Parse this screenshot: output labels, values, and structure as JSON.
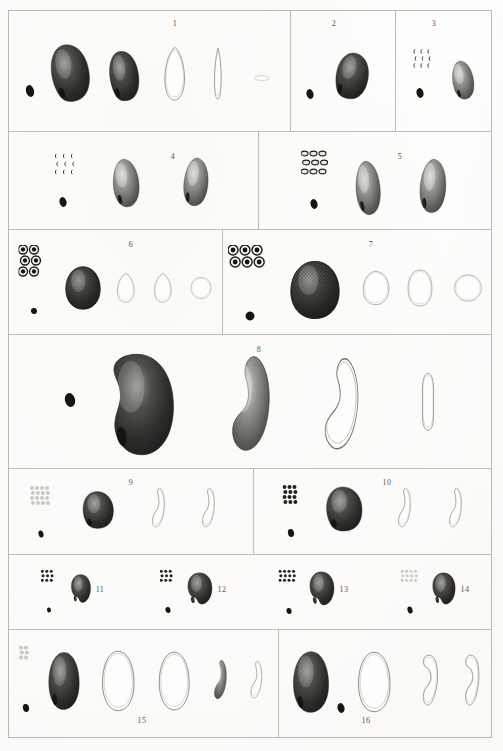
{
  "plate": {
    "title": "Engraved natural history plate of seed specimens",
    "medium": "stipple engraving on paper",
    "background_color": "#fbfaf8",
    "ink_color": "#2a2a28",
    "rule_color": "#bdbdb8",
    "frame": {
      "x": 8,
      "y": 10,
      "width": 484,
      "height": 728
    },
    "figure_count": 16
  },
  "rows": [
    {
      "id": "row-1",
      "top": 10,
      "bottom": 131
    },
    {
      "id": "row-2",
      "top": 131,
      "bottom": 229
    },
    {
      "id": "row-3",
      "top": 229,
      "bottom": 334
    },
    {
      "id": "row-4",
      "top": 334,
      "bottom": 468
    },
    {
      "id": "row-5",
      "top": 468,
      "bottom": 554
    },
    {
      "id": "row-6",
      "top": 554,
      "bottom": 629
    },
    {
      "id": "row-7",
      "top": 629,
      "bottom": 738
    }
  ],
  "figures": [
    {
      "number": "1",
      "row": 1,
      "panel": {
        "x": 8,
        "y": 10,
        "w": 282,
        "h": 121
      },
      "label": {
        "x": 175,
        "y": 19
      },
      "tiny_seed": {
        "x": 30,
        "y": 91,
        "rx": 4,
        "ry": 6
      },
      "dot_cluster": null,
      "specimens": [
        {
          "name": "seed-dorsal-view",
          "kind": "bean-dark",
          "cx": 70,
          "cy": 73,
          "w": 44,
          "h": 62,
          "rot": -8,
          "tone": "dark"
        },
        {
          "name": "seed-lateral-view",
          "kind": "bean-dark",
          "cx": 124,
          "cy": 76,
          "w": 34,
          "h": 54,
          "rot": -6,
          "tone": "dark"
        },
        {
          "name": "seed-section-outline",
          "kind": "teardrop-outline",
          "cx": 175,
          "cy": 74,
          "w": 28,
          "h": 58,
          "rot": 0,
          "tone": "outline"
        },
        {
          "name": "seed-embryo-outline",
          "kind": "sliver-outline",
          "cx": 218,
          "cy": 74,
          "w": 18,
          "h": 56,
          "rot": 0,
          "tone": "outline"
        },
        {
          "name": "seed-transverse-outline",
          "kind": "ellipse-outline",
          "cx": 262,
          "cy": 78,
          "w": 20,
          "h": 11,
          "rot": 0,
          "tone": "outline"
        }
      ]
    },
    {
      "number": "2",
      "row": 1,
      "panel": {
        "x": 290,
        "y": 10,
        "w": 105,
        "h": 121
      },
      "label": {
        "x": 334,
        "y": 19
      },
      "tiny_seed": {
        "x": 310,
        "y": 92,
        "rx": 3.5,
        "ry": 5
      },
      "dot_cluster": null,
      "specimens": [
        {
          "name": "seed-dorsal-view",
          "kind": "bean-dark",
          "cx": 352,
          "cy": 76,
          "w": 38,
          "h": 50,
          "rot": 12,
          "tone": "dark"
        }
      ]
    },
    {
      "number": "3",
      "row": 1,
      "panel": {
        "x": 395,
        "y": 10,
        "w": 97,
        "h": 121
      },
      "label": {
        "x": 434,
        "y": 19
      },
      "tiny_seed": {
        "x": 420,
        "y": 91,
        "rx": 3.5,
        "ry": 5
      },
      "dot_cluster": {
        "x": 424,
        "y": 62,
        "cols": 3,
        "rows": 3,
        "dot": "crescent",
        "size": 5,
        "gap": 7
      },
      "specimens": [
        {
          "name": "seed-dorsal-view",
          "kind": "bean-stipple",
          "cx": 463,
          "cy": 80,
          "w": 26,
          "h": 42,
          "rot": -10,
          "tone": "mid"
        }
      ]
    },
    {
      "number": "4",
      "row": 2,
      "panel": {
        "x": 8,
        "y": 131,
        "w": 250,
        "h": 98
      },
      "label": {
        "x": 173,
        "y": 152
      },
      "tiny_seed": {
        "x": 63,
        "y": 200,
        "rx": 3.5,
        "ry": 5
      },
      "dot_cluster": {
        "x": 67,
        "y": 168,
        "cols": 3,
        "rows": 3,
        "dot": "crescent",
        "size": 5,
        "gap": 8
      },
      "specimens": [
        {
          "name": "seed-dorsal-view",
          "kind": "bean-stipple",
          "cx": 126,
          "cy": 183,
          "w": 32,
          "h": 52,
          "rot": -6,
          "tone": "mid"
        },
        {
          "name": "seed-lateral-view",
          "kind": "bean-stipple",
          "cx": 196,
          "cy": 182,
          "w": 30,
          "h": 52,
          "rot": 4,
          "tone": "mid"
        }
      ]
    },
    {
      "number": "5",
      "row": 2,
      "panel": {
        "x": 258,
        "y": 131,
        "w": 234,
        "h": 98
      },
      "label": {
        "x": 400,
        "y": 152
      },
      "tiny_seed": {
        "x": 314,
        "y": 202,
        "rx": 3.5,
        "ry": 5
      },
      "dot_cluster": {
        "x": 318,
        "y": 167,
        "cols": 3,
        "rows": 3,
        "dot": "oval",
        "size": 7,
        "gap": 9
      },
      "specimens": [
        {
          "name": "seed-dorsal-view",
          "kind": "bean-stipple",
          "cx": 368,
          "cy": 188,
          "w": 30,
          "h": 58,
          "rot": -5,
          "tone": "mid"
        },
        {
          "name": "seed-lateral-view",
          "kind": "bean-stipple",
          "cx": 433,
          "cy": 186,
          "w": 32,
          "h": 58,
          "rot": 3,
          "tone": "mid"
        }
      ]
    },
    {
      "number": "6",
      "row": 3,
      "panel": {
        "x": 8,
        "y": 229,
        "w": 214,
        "h": 105
      },
      "label": {
        "x": 131,
        "y": 240
      },
      "tiny_seed": {
        "x": 34,
        "y": 305,
        "rx": 3,
        "ry": 3
      },
      "dot_cluster": {
        "x": 34,
        "y": 266,
        "cols": 2,
        "rows": 3,
        "dot": "ring",
        "size": 9,
        "gap": 11
      },
      "specimens": [
        {
          "name": "seed-reticulate-view",
          "kind": "reticulate",
          "cx": 83,
          "cy": 288,
          "w": 40,
          "h": 46,
          "rot": 0,
          "tone": "dark"
        },
        {
          "name": "seed-section-outline",
          "kind": "teardrop-outline",
          "cx": 126,
          "cy": 288,
          "w": 24,
          "h": 32,
          "rot": 0,
          "tone": "outline"
        },
        {
          "name": "seed-lateral-outline",
          "kind": "teardrop-outline",
          "cx": 163,
          "cy": 288,
          "w": 24,
          "h": 32,
          "rot": 0,
          "tone": "outline"
        },
        {
          "name": "seed-transverse-outline",
          "kind": "disc-outline",
          "cx": 201,
          "cy": 288,
          "w": 24,
          "h": 24,
          "rot": 0,
          "tone": "outline"
        }
      ]
    },
    {
      "number": "7",
      "row": 3,
      "panel": {
        "x": 222,
        "y": 229,
        "w": 270,
        "h": 105
      },
      "label": {
        "x": 371,
        "y": 240
      },
      "tiny_seed": {
        "x": 250,
        "y": 313,
        "rx": 4.5,
        "ry": 4.5
      },
      "dot_cluster": {
        "x": 251,
        "y": 262,
        "cols": 3,
        "rows": 2,
        "dot": "ring",
        "size": 10,
        "gap": 12
      },
      "specimens": [
        {
          "name": "seed-reticulate-view",
          "kind": "reticulate",
          "cx": 315,
          "cy": 290,
          "w": 56,
          "h": 62,
          "rot": 0,
          "tone": "dark"
        },
        {
          "name": "seed-section-outline",
          "kind": "bean-outline",
          "cx": 376,
          "cy": 288,
          "w": 32,
          "h": 38,
          "rot": 0,
          "tone": "outline"
        },
        {
          "name": "seed-lateral-outline",
          "kind": "oval-outline",
          "cx": 420,
          "cy": 288,
          "w": 30,
          "h": 40,
          "rot": 0,
          "tone": "outline"
        },
        {
          "name": "seed-transverse-outline",
          "kind": "disc-outline",
          "cx": 468,
          "cy": 288,
          "w": 32,
          "h": 30,
          "rot": 0,
          "tone": "outline"
        }
      ]
    },
    {
      "number": "8",
      "row": 4,
      "panel": {
        "x": 8,
        "y": 334,
        "w": 484,
        "h": 134
      },
      "label": {
        "x": 259,
        "y": 345
      },
      "tiny_seed": {
        "x": 70,
        "y": 400,
        "rx": 5,
        "ry": 7
      },
      "dot_cluster": null,
      "specimens": [
        {
          "name": "seed-dorsal-view-large",
          "kind": "kidney-shaded",
          "cx": 140,
          "cy": 404,
          "w": 76,
          "h": 108,
          "rot": 0,
          "tone": "dark"
        },
        {
          "name": "seed-section-shaded",
          "kind": "crescent-shaded",
          "cx": 249,
          "cy": 404,
          "w": 54,
          "h": 100,
          "rot": 0,
          "tone": "mid"
        },
        {
          "name": "seed-section-outline",
          "kind": "crescent-outline",
          "cx": 340,
          "cy": 404,
          "w": 50,
          "h": 98,
          "rot": 0,
          "tone": "outline"
        },
        {
          "name": "seed-embryo-outline",
          "kind": "capsule-outline",
          "cx": 428,
          "cy": 402,
          "w": 20,
          "h": 62,
          "rot": 0,
          "tone": "outline"
        }
      ]
    },
    {
      "number": "9",
      "row": 5,
      "panel": {
        "x": 8,
        "y": 468,
        "w": 245,
        "h": 86
      },
      "label": {
        "x": 131,
        "y": 478
      },
      "tiny_seed": {
        "x": 41,
        "y": 529,
        "rx": 2.5,
        "ry": 3.5
      },
      "dot_cluster": {
        "x": 42,
        "y": 498,
        "cols": 4,
        "rows": 4,
        "dot": "pale",
        "size": 4,
        "gap": 5
      },
      "specimens": [
        {
          "name": "seed-dorsal-view",
          "kind": "bean-dark",
          "cx": 98,
          "cy": 510,
          "w": 36,
          "h": 40,
          "rot": 0,
          "tone": "dark"
        },
        {
          "name": "seed-section-outline",
          "kind": "comma-outline",
          "cx": 158,
          "cy": 508,
          "w": 22,
          "h": 42,
          "rot": 0,
          "tone": "outline"
        },
        {
          "name": "seed-lateral-outline",
          "kind": "comma-outline",
          "cx": 208,
          "cy": 508,
          "w": 22,
          "h": 42,
          "rot": 0,
          "tone": "outline"
        }
      ]
    },
    {
      "number": "10",
      "row": 5,
      "panel": {
        "x": 253,
        "y": 468,
        "w": 239,
        "h": 86
      },
      "label": {
        "x": 387,
        "y": 478
      },
      "tiny_seed": {
        "x": 291,
        "y": 529,
        "rx": 3,
        "ry": 4
      },
      "dot_cluster": {
        "x": 292,
        "y": 497,
        "cols": 3,
        "rows": 4,
        "dot": "dark",
        "size": 4,
        "gap": 5
      },
      "specimens": [
        {
          "name": "seed-dorsal-view",
          "kind": "bean-dark",
          "cx": 344,
          "cy": 509,
          "w": 42,
          "h": 48,
          "rot": 0,
          "tone": "dark"
        },
        {
          "name": "seed-section-outline",
          "kind": "comma-outline",
          "cx": 404,
          "cy": 508,
          "w": 22,
          "h": 42,
          "rot": 0,
          "tone": "outline"
        },
        {
          "name": "seed-lateral-outline",
          "kind": "comma-outline",
          "cx": 455,
          "cy": 508,
          "w": 22,
          "h": 42,
          "rot": 0,
          "tone": "outline"
        }
      ]
    },
    {
      "number": "11",
      "row": 6,
      "panel": {
        "x": 8,
        "y": 554,
        "w": 121,
        "h": 75
      },
      "label": {
        "x": 100,
        "y": 585
      },
      "tiny_seed": {
        "x": 49,
        "y": 603,
        "rx": 2,
        "ry": 2.5
      },
      "dot_cluster": {
        "x": 49,
        "y": 578,
        "cols": 3,
        "rows": 3,
        "dot": "dark",
        "size": 3,
        "gap": 4.5
      },
      "specimens": [
        {
          "name": "seed-dorsal-view",
          "kind": "pear-dark",
          "cx": 81,
          "cy": 589,
          "w": 24,
          "h": 32,
          "rot": 0,
          "tone": "dark"
        }
      ]
    },
    {
      "number": "12",
      "row": 6,
      "panel": {
        "x": 129,
        "y": 554,
        "w": 121,
        "h": 75
      },
      "label": {
        "x": 222,
        "y": 585
      },
      "tiny_seed": {
        "x": 168,
        "y": 604,
        "rx": 2.5,
        "ry": 3
      },
      "dot_cluster": {
        "x": 168,
        "y": 578,
        "cols": 3,
        "rows": 3,
        "dot": "dark",
        "size": 3,
        "gap": 4.5
      },
      "specimens": [
        {
          "name": "seed-dorsal-view",
          "kind": "pear-dark",
          "cx": 200,
          "cy": 589,
          "w": 30,
          "h": 36,
          "rot": 0,
          "tone": "dark"
        }
      ]
    },
    {
      "number": "13",
      "row": 6,
      "panel": {
        "x": 250,
        "y": 554,
        "w": 121,
        "h": 75
      },
      "label": {
        "x": 344,
        "y": 585
      },
      "tiny_seed": {
        "x": 289,
        "y": 605,
        "rx": 2.5,
        "ry": 3
      },
      "dot_cluster": {
        "x": 289,
        "y": 578,
        "cols": 4,
        "rows": 3,
        "dot": "dark",
        "size": 3,
        "gap": 4.5
      },
      "specimens": [
        {
          "name": "seed-dorsal-view",
          "kind": "pear-dark",
          "cx": 322,
          "cy": 589,
          "w": 30,
          "h": 38,
          "rot": 0,
          "tone": "dark"
        }
      ]
    },
    {
      "number": "14",
      "row": 6,
      "panel": {
        "x": 371,
        "y": 554,
        "w": 121,
        "h": 75
      },
      "label": {
        "x": 465,
        "y": 585
      },
      "tiny_seed": {
        "x": 410,
        "y": 605,
        "rx": 2.5,
        "ry": 3.5
      },
      "dot_cluster": {
        "x": 411,
        "y": 578,
        "cols": 4,
        "rows": 3,
        "dot": "pale",
        "size": 3,
        "gap": 4.5
      },
      "specimens": [
        {
          "name": "seed-dorsal-view",
          "kind": "pear-dark",
          "cx": 444,
          "cy": 589,
          "w": 28,
          "h": 36,
          "rot": 0,
          "tone": "dark"
        }
      ]
    },
    {
      "number": "15",
      "row": 7,
      "panel": {
        "x": 8,
        "y": 629,
        "w": 270,
        "h": 109
      },
      "label": {
        "x": 142,
        "y": 716
      },
      "tiny_seed": {
        "x": 26,
        "y": 704,
        "rx": 3,
        "ry": 4
      },
      "dot_cluster": {
        "x": 26,
        "y": 655,
        "cols": 2,
        "rows": 3,
        "dot": "pale",
        "size": 4,
        "gap": 5
      },
      "specimens": [
        {
          "name": "seed-dorsal-view",
          "kind": "ovoid-dark",
          "cx": 64,
          "cy": 681,
          "w": 38,
          "h": 62,
          "rot": 0,
          "tone": "dark"
        },
        {
          "name": "seed-section-outline",
          "kind": "ovoid-outline",
          "cx": 118,
          "cy": 681,
          "w": 40,
          "h": 66,
          "rot": 0,
          "tone": "outline"
        },
        {
          "name": "seed-lateral-outline",
          "kind": "ovoid-outline",
          "cx": 174,
          "cy": 681,
          "w": 38,
          "h": 64,
          "rot": 0,
          "tone": "outline"
        },
        {
          "name": "seed-embryo-shaded",
          "kind": "comma-shaded",
          "cx": 220,
          "cy": 680,
          "w": 22,
          "h": 42,
          "rot": 0,
          "tone": "mid"
        },
        {
          "name": "seed-embryo-outline",
          "kind": "comma-outline",
          "cx": 256,
          "cy": 680,
          "w": 20,
          "h": 40,
          "rot": 0,
          "tone": "outline"
        }
      ]
    },
    {
      "number": "16",
      "row": 7,
      "panel": {
        "x": 278,
        "y": 629,
        "w": 214,
        "h": 109
      },
      "label": {
        "x": 366,
        "y": 716
      },
      "tiny_seed": {
        "x": 341,
        "y": 706,
        "rx": 3.5,
        "ry": 5
      },
      "dot_cluster": null,
      "specimens": [
        {
          "name": "seed-dorsal-view",
          "kind": "ovoid-dark",
          "cx": 311,
          "cy": 682,
          "w": 44,
          "h": 66,
          "rot": 0,
          "tone": "dark"
        },
        {
          "name": "seed-section-outline",
          "kind": "ovoid-outline",
          "cx": 374,
          "cy": 682,
          "w": 40,
          "h": 66,
          "rot": 0,
          "tone": "outline"
        },
        {
          "name": "seed-embryo-outline",
          "kind": "hook-outline",
          "cx": 428,
          "cy": 681,
          "w": 28,
          "h": 54,
          "rot": 0,
          "tone": "outline"
        },
        {
          "name": "seed-embryo-outline-2",
          "kind": "hook-outline",
          "cx": 470,
          "cy": 681,
          "w": 26,
          "h": 54,
          "rot": 0,
          "tone": "outline"
        }
      ]
    }
  ],
  "dividers": {
    "horizontal": [
      131,
      229,
      334,
      468,
      554,
      629
    ],
    "vertical": [
      {
        "row": 1,
        "x": [
          290,
          395
        ]
      },
      {
        "row": 2,
        "x": [
          258
        ]
      },
      {
        "row": 3,
        "x": [
          222
        ]
      },
      {
        "row": 4,
        "x": []
      },
      {
        "row": 5,
        "x": [
          253
        ]
      },
      {
        "row": 6,
        "x": []
      },
      {
        "row": 7,
        "x": [
          278
        ]
      }
    ]
  }
}
